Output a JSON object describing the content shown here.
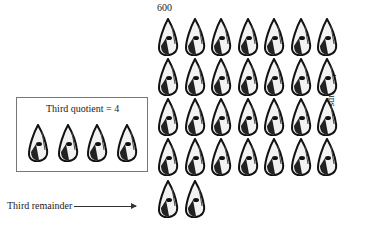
{
  "labels": {
    "top": "600",
    "quotient": "Third quotient = 4",
    "remainder": "Third remainder",
    "groups": "4 groups"
  },
  "grid": {
    "rows": [
      7,
      7,
      7,
      7,
      2
    ],
    "cone_icon": "shell-cone"
  },
  "quotient_cones": 4
}
